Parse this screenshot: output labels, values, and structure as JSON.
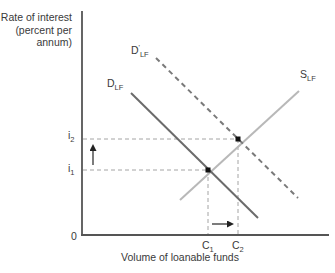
{
  "diagram": {
    "type": "supply-demand",
    "y_axis": {
      "label_lines": [
        "Rate of interest",
        "(percent per",
        "annum)"
      ],
      "ticks": [
        {
          "id": "i2",
          "base": "i",
          "sub": "2"
        },
        {
          "id": "i1",
          "base": "i",
          "sub": "1"
        }
      ]
    },
    "x_axis": {
      "label": "Volume of loanable funds",
      "origin": "0",
      "ticks": [
        {
          "id": "C1",
          "base": "C",
          "sub": "1"
        },
        {
          "id": "C2",
          "base": "C",
          "sub": "2"
        }
      ]
    },
    "curves": [
      {
        "id": "D_LF",
        "base": "D",
        "sub": "LF",
        "style": "solid",
        "color": "#6b6b6b",
        "description": "Original demand for loanable funds"
      },
      {
        "id": "D'_LF",
        "base": "D",
        "sup": "'",
        "sub": "LF",
        "style": "dashed",
        "color": "#7a7a7a",
        "description": "Shifted demand for loanable funds"
      },
      {
        "id": "S_LF",
        "base": "S",
        "sub": "LF",
        "style": "solid",
        "color": "#b5b5b5",
        "description": "Supply of loanable funds"
      }
    ],
    "equilibria": [
      {
        "id": "E1",
        "rate": "i1",
        "quantity": "C1"
      },
      {
        "id": "E2",
        "rate": "i2",
        "quantity": "C2"
      }
    ],
    "arrows": [
      {
        "id": "rate-up",
        "from": "i1",
        "to": "i2",
        "direction": "up"
      },
      {
        "id": "quantity-right",
        "from": "C1",
        "to": "C2",
        "direction": "right"
      }
    ],
    "colors": {
      "axis": "#555555",
      "demand": "#6b6b6b",
      "demand_shifted": "#7a7a7a",
      "supply": "#b5b5b5",
      "guide": "#9a9a9a",
      "point": "#111111"
    }
  }
}
